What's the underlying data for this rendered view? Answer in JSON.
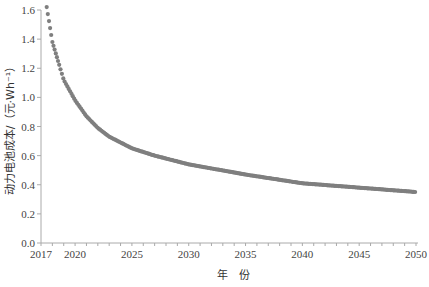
{
  "chart_data": {
    "type": "scatter",
    "title": "",
    "xlabel": "年　份",
    "ylabel": "动力电池成本/（元·Wh⁻¹）",
    "xlim": [
      2017,
      2050
    ],
    "ylim": [
      0.0,
      1.6
    ],
    "xticks": [
      2017,
      2020,
      2025,
      2030,
      2035,
      2040,
      2045,
      2050
    ],
    "yticks": [
      0.0,
      0.2,
      0.4,
      0.6,
      0.8,
      1.0,
      1.2,
      1.4,
      1.6
    ],
    "ytick_labels": [
      "0.0",
      "0.2",
      "0.4",
      "0.6",
      "0.8",
      "1.0",
      "1.2",
      "1.4",
      "1.6"
    ],
    "grid": false,
    "legend": null,
    "marker_color": "#7f7f7f",
    "series": [
      {
        "name": "动力电池成本",
        "x": [
          2017.5,
          2018,
          2019,
          2020,
          2021,
          2022,
          2023,
          2025,
          2027,
          2030,
          2035,
          2040,
          2045,
          2050
        ],
        "values": [
          1.62,
          1.38,
          1.12,
          0.98,
          0.87,
          0.79,
          0.73,
          0.65,
          0.6,
          0.54,
          0.47,
          0.41,
          0.38,
          0.35
        ]
      }
    ]
  },
  "axes": {
    "x_title": "年　份",
    "y_title": "动力电池成本/（元·Wh⁻¹）"
  }
}
